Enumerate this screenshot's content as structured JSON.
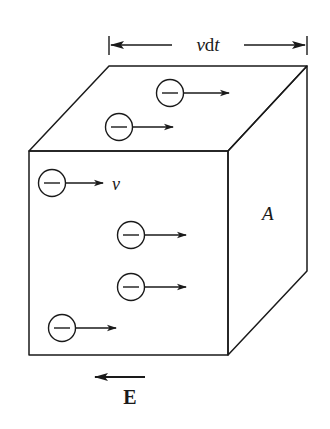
{
  "figure": {
    "background": "#ffffff",
    "stroke_color": "#1a1a1a",
    "labels": {
      "width": "vdt",
      "width_v": "v",
      "width_d": "d",
      "width_t": "t",
      "velocity": "v",
      "area": "A",
      "field": "E"
    },
    "cube": {
      "front_face": {
        "x1": 29,
        "y1": 151,
        "x2": 228,
        "y2": 355
      },
      "depth_offset": {
        "dx": 79,
        "dy": -85
      }
    },
    "electrons": [
      {
        "cx": 170,
        "cy": 93,
        "sign": "−"
      },
      {
        "cx": 119,
        "cy": 127,
        "sign": "−"
      },
      {
        "cx": 52,
        "cy": 183,
        "sign": "−"
      },
      {
        "cx": 131,
        "cy": 235,
        "sign": "−"
      },
      {
        "cx": 131,
        "cy": 287,
        "sign": "−"
      },
      {
        "cx": 62,
        "cy": 328,
        "sign": "−"
      }
    ],
    "electron_direction": "right",
    "field_direction": "left"
  }
}
